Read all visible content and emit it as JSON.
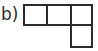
{
  "figure": {
    "label": "b)",
    "shape_name": "L-tetromino",
    "grid": {
      "columns": 3,
      "rows": 2,
      "cell_count": 4,
      "cell_width_px": 23,
      "cell_height_px": 22,
      "occupied_cells": [
        {
          "row": 0,
          "col": 0
        },
        {
          "row": 0,
          "col": 1
        },
        {
          "row": 0,
          "col": 2
        },
        {
          "row": 1,
          "col": 2
        }
      ]
    },
    "colors": {
      "stroke": "#2b2b2b",
      "fill": "#ffffff",
      "background": "#ffffff"
    },
    "stroke_width_px": 2
  }
}
